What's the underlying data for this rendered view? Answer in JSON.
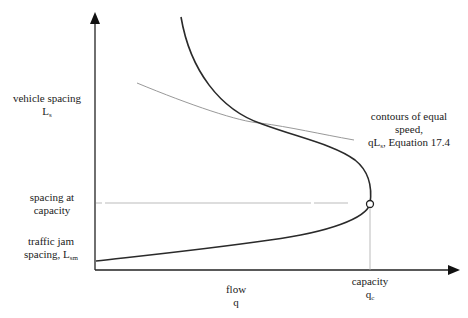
{
  "figure": {
    "y_axis": {
      "label": "vehicle spacing",
      "symbol": "L",
      "symbol_sub": "s"
    },
    "x_axis": {
      "label": "flow",
      "symbol": "q"
    },
    "annotations": {
      "spacing_at_capacity": [
        "spacing at",
        "capacity"
      ],
      "jam_spacing": {
        "line1": "traffic jam",
        "line2_prefix": "spacing, L",
        "line2_sub": "sm"
      },
      "capacity": {
        "label": "capacity",
        "symbol": "q",
        "symbol_sub": "c"
      },
      "contours": {
        "line1": "contours of equal",
        "line2": "speed,",
        "line3_prefix": "qL",
        "line3_sub": "s",
        "line3_suffix": ", Equation 17.4"
      }
    },
    "colors": {
      "axis": "#222222",
      "curve": "#2a2a2a",
      "contour": "#999999",
      "guide": "#aaaaaa"
    }
  }
}
